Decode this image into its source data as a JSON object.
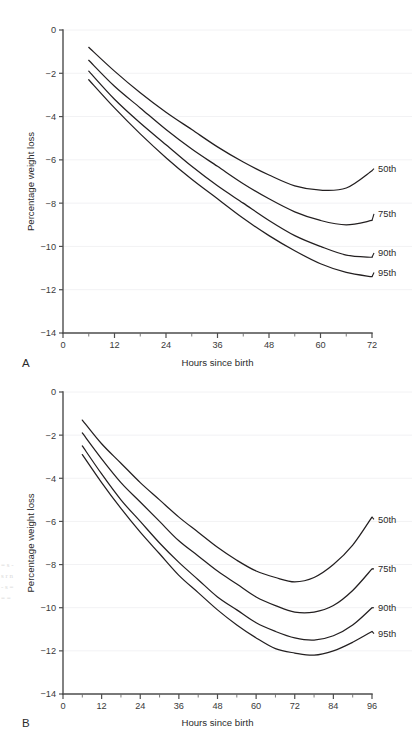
{
  "figure": {
    "panels": [
      {
        "letter": "A",
        "xlabel": "Hours since birth",
        "ylabel": "Percentage weight loss",
        "x_ticks": [
          0,
          12,
          24,
          36,
          48,
          60,
          72
        ],
        "x_minor_step": 6,
        "y_ticks": [
          0,
          -2,
          -4,
          -6,
          -8,
          -10,
          -12,
          -14
        ],
        "xlim": [
          0,
          72
        ],
        "ylim": [
          -14,
          0
        ],
        "series_labels": [
          "50th",
          "75th",
          "90th",
          "95th"
        ]
      },
      {
        "letter": "B",
        "xlabel": "Hours since birth",
        "ylabel": "Percentage weight loss",
        "x_ticks": [
          0,
          12,
          24,
          36,
          48,
          60,
          72,
          84,
          96
        ],
        "x_minor_step": 6,
        "y_ticks": [
          0,
          -2,
          -4,
          -6,
          -8,
          -10,
          -12,
          -14
        ],
        "xlim": [
          0,
          96
        ],
        "ylim": [
          -14,
          0
        ],
        "series_labels": [
          "50th",
          "75th",
          "90th",
          "95th"
        ]
      }
    ],
    "edge_artifact": "= s - s r n - s = = ="
  },
  "chart_data": [
    {
      "type": "line",
      "title": "",
      "panel": "A",
      "xlabel": "Hours since birth",
      "ylabel": "Percentage weight loss",
      "xlim": [
        0,
        72
      ],
      "ylim": [
        -14,
        0
      ],
      "x_ticks": [
        0,
        12,
        24,
        36,
        48,
        60,
        72
      ],
      "y_ticks": [
        0,
        -2,
        -4,
        -6,
        -8,
        -10,
        -12,
        -14
      ],
      "grid": true,
      "legend_position": "right-inline-labels",
      "x": [
        6,
        12,
        18,
        24,
        30,
        36,
        42,
        48,
        54,
        60,
        66,
        72
      ],
      "series": [
        {
          "name": "50th",
          "values": [
            -0.8,
            -1.9,
            -2.9,
            -3.8,
            -4.6,
            -5.4,
            -6.1,
            -6.7,
            -7.2,
            -7.4,
            -7.3,
            -6.5
          ],
          "label_y": -6.4
        },
        {
          "name": "75th",
          "values": [
            -1.4,
            -2.6,
            -3.6,
            -4.6,
            -5.5,
            -6.3,
            -7.1,
            -7.8,
            -8.4,
            -8.8,
            -9.0,
            -8.8
          ],
          "label_y": -8.5
        },
        {
          "name": "90th",
          "values": [
            -1.9,
            -3.2,
            -4.3,
            -5.3,
            -6.3,
            -7.2,
            -8.0,
            -8.8,
            -9.5,
            -10.0,
            -10.4,
            -10.5
          ],
          "label_y": -10.3
        },
        {
          "name": "95th",
          "values": [
            -2.3,
            -3.6,
            -4.8,
            -5.9,
            -6.9,
            -7.8,
            -8.7,
            -9.5,
            -10.2,
            -10.8,
            -11.2,
            -11.4
          ],
          "label_y": -11.2
        }
      ]
    },
    {
      "type": "line",
      "title": "",
      "panel": "B",
      "xlabel": "Hours since birth",
      "ylabel": "Percentage weight loss",
      "xlim": [
        0,
        96
      ],
      "ylim": [
        -14,
        0
      ],
      "x_ticks": [
        0,
        12,
        24,
        36,
        48,
        60,
        72,
        84,
        96
      ],
      "y_ticks": [
        0,
        -2,
        -4,
        -6,
        -8,
        -10,
        -12,
        -14
      ],
      "grid": true,
      "legend_position": "right-inline-labels",
      "x": [
        6,
        12,
        18,
        24,
        30,
        36,
        42,
        48,
        54,
        60,
        66,
        72,
        78,
        84,
        90,
        96
      ],
      "series": [
        {
          "name": "50th",
          "values": [
            -1.3,
            -2.4,
            -3.3,
            -4.2,
            -5.0,
            -5.8,
            -6.5,
            -7.2,
            -7.8,
            -8.3,
            -8.6,
            -8.8,
            -8.6,
            -8.0,
            -7.1,
            -5.8
          ],
          "label_y": -5.9
        },
        {
          "name": "75th",
          "values": [
            -1.9,
            -3.1,
            -4.2,
            -5.1,
            -6.0,
            -6.9,
            -7.6,
            -8.3,
            -8.9,
            -9.5,
            -9.9,
            -10.2,
            -10.2,
            -9.9,
            -9.2,
            -8.2
          ],
          "label_y": -8.2
        },
        {
          "name": "90th",
          "values": [
            -2.5,
            -3.8,
            -5.0,
            -6.0,
            -7.0,
            -7.9,
            -8.7,
            -9.5,
            -10.1,
            -10.7,
            -11.1,
            -11.4,
            -11.5,
            -11.3,
            -10.8,
            -10.0
          ],
          "label_y": -10.0
        },
        {
          "name": "95th",
          "values": [
            -2.9,
            -4.2,
            -5.4,
            -6.5,
            -7.5,
            -8.5,
            -9.3,
            -10.1,
            -10.8,
            -11.4,
            -11.9,
            -12.1,
            -12.2,
            -12.0,
            -11.6,
            -11.1
          ],
          "label_y": -11.2
        }
      ]
    }
  ]
}
